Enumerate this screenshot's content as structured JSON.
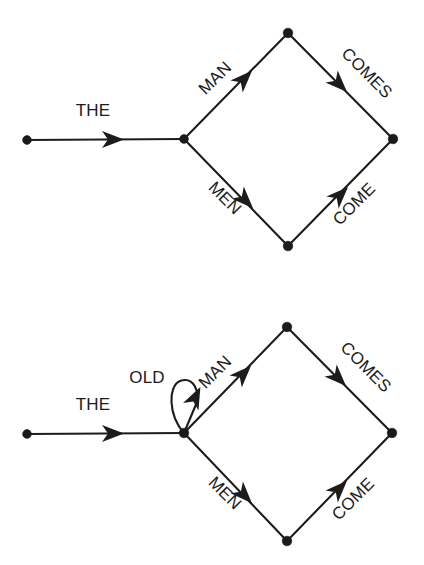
{
  "figure": {
    "background_color": "#ffffff",
    "ink_color": "#1c1c1c",
    "node_color": "#1a1a1a"
  },
  "diagrams": [
    {
      "id": "lattice-without-old",
      "name": "the-man-men-comes-come-lattice",
      "nodes": [
        {
          "id": "n0",
          "name": "start-node",
          "x": 27,
          "y": 140
        },
        {
          "id": "n1",
          "name": "branch-node",
          "x": 184,
          "y": 139
        },
        {
          "id": "n2",
          "name": "top-node",
          "x": 288,
          "y": 33
        },
        {
          "id": "n3",
          "name": "bottom-node",
          "x": 288,
          "y": 246
        },
        {
          "id": "n4",
          "name": "end-node",
          "x": 393,
          "y": 139
        }
      ],
      "edges": [
        {
          "id": "e0",
          "from": "n0",
          "to": "n1",
          "label": "THE",
          "label_x": 93,
          "label_y": 116,
          "rotation": 0
        },
        {
          "id": "e1",
          "from": "n1",
          "to": "n2",
          "label": "MAN",
          "label_x": 219,
          "label_y": 82,
          "rotation": -45
        },
        {
          "id": "e2",
          "from": "n1",
          "to": "n3",
          "label": "MEN",
          "label_x": 221,
          "label_y": 202,
          "rotation": 45
        },
        {
          "id": "e3",
          "from": "n2",
          "to": "n4",
          "label": "COMES",
          "label_x": 363,
          "label_y": 77,
          "rotation": 45
        },
        {
          "id": "e4",
          "from": "n3",
          "to": "n4",
          "label": "COME",
          "label_x": 358,
          "label_y": 208,
          "rotation": -45
        }
      ],
      "loops": []
    },
    {
      "id": "lattice-with-old",
      "name": "the-old-man-men-comes-come-lattice",
      "nodes": [
        {
          "id": "m0",
          "name": "start-node",
          "x": 27,
          "y": 434
        },
        {
          "id": "m1",
          "name": "branch-node",
          "x": 184,
          "y": 433
        },
        {
          "id": "m2",
          "name": "top-node",
          "x": 287,
          "y": 327
        },
        {
          "id": "m3",
          "name": "bottom-node",
          "x": 287,
          "y": 541
        },
        {
          "id": "m4",
          "name": "end-node",
          "x": 392,
          "y": 433
        }
      ],
      "edges": [
        {
          "id": "f0",
          "from": "m0",
          "to": "m1",
          "label": "THE",
          "label_x": 93,
          "label_y": 410,
          "rotation": 0
        },
        {
          "id": "f1",
          "from": "m1",
          "to": "m2",
          "label": "MAN",
          "label_x": 219,
          "label_y": 376,
          "rotation": -45
        },
        {
          "id": "f2",
          "from": "m1",
          "to": "m3",
          "label": "MEN",
          "label_x": 221,
          "label_y": 497,
          "rotation": 45
        },
        {
          "id": "f3",
          "from": "m2",
          "to": "m4",
          "label": "COMES",
          "label_x": 362,
          "label_y": 371,
          "rotation": 45
        },
        {
          "id": "f4",
          "from": "m3",
          "to": "m4",
          "label": "COME",
          "label_x": 357,
          "label_y": 503,
          "rotation": -45
        }
      ],
      "loops": [
        {
          "id": "l0",
          "name": "old-self-loop",
          "at": "m1",
          "label": "OLD",
          "label_x": 147,
          "label_y": 383,
          "rotation": 0
        }
      ]
    }
  ]
}
